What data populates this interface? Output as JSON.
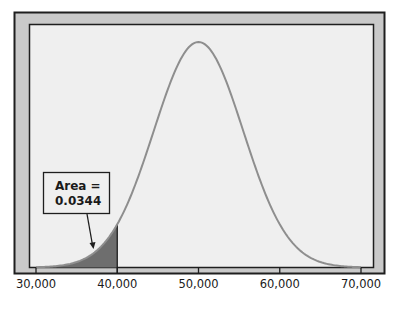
{
  "chart_data": {
    "type": "area",
    "title": "",
    "xlabel": "",
    "ylabel": "",
    "distribution": "normal",
    "mean": 50000,
    "std_dev": 5500,
    "xlim": [
      30000,
      70000
    ],
    "x_ticks": [
      30000,
      40000,
      50000,
      60000,
      70000
    ],
    "x_tick_labels": [
      "30,000",
      "40,000",
      "50,000",
      "60,000",
      "70,000"
    ],
    "shaded_region": {
      "from": 30000,
      "to": 40000,
      "area": 0.0344
    },
    "annotation": {
      "line1": "Area =",
      "line2": "0.0344"
    },
    "grid": false,
    "legend": null
  },
  "colors": {
    "frame_fill": "#c9c9c9",
    "frame_border": "#1e1e1e",
    "plot_bg": "#efefef",
    "curve": "#8e8e8e",
    "shade": "#6e6e6e",
    "axis": "#1e1e1e"
  },
  "annotation": {
    "line1": "Area =",
    "line2": "0.0344"
  },
  "ticks": [
    "30,000",
    "40,000",
    "50,000",
    "60,000",
    "70,000"
  ]
}
